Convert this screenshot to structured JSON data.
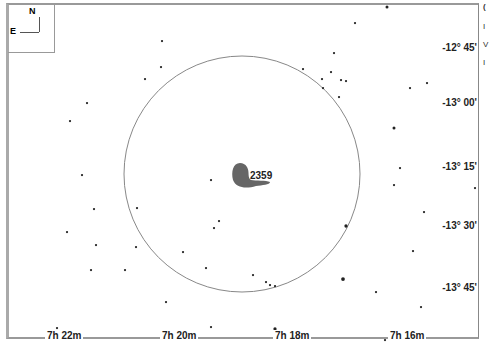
{
  "map": {
    "object_label": "2359",
    "orientation": {
      "north": "N",
      "east": "E"
    },
    "credit": "Megastar",
    "dec_labels": [
      {
        "text": "-12° 45'",
        "y": 48
      },
      {
        "text": "-13° 00'",
        "y": 103
      },
      {
        "text": "-13° 15'",
        "y": 167
      },
      {
        "text": "-13° 30'",
        "y": 226
      },
      {
        "text": "-13° 45'",
        "y": 288
      }
    ],
    "ra_labels": [
      {
        "text": "7h 22m",
        "x": 45
      },
      {
        "text": "7h 20m",
        "x": 160
      },
      {
        "text": "7h 18m",
        "x": 273
      },
      {
        "text": "7h 16m",
        "x": 388
      }
    ],
    "fov_circle": {
      "cx": 242,
      "cy": 174,
      "r": 118,
      "color": "#888888"
    },
    "nebula_color": "#666666",
    "stars": [
      [
        387,
        7,
        2
      ],
      [
        355,
        23,
        1.5
      ],
      [
        162,
        41,
        1.5
      ],
      [
        334,
        53,
        1.5
      ],
      [
        161,
        67,
        1.5
      ],
      [
        145,
        79,
        1.5
      ],
      [
        303,
        69,
        1.5
      ],
      [
        331,
        72,
        1.5
      ],
      [
        341,
        80,
        1.5
      ],
      [
        322,
        79,
        1.5
      ],
      [
        346,
        81,
        1.5
      ],
      [
        323,
        88,
        1.5
      ],
      [
        339,
        97,
        1.5
      ],
      [
        410,
        88,
        1.5
      ],
      [
        427,
        83,
        1.5
      ],
      [
        87,
        103,
        1.5
      ],
      [
        70,
        121,
        1.5
      ],
      [
        394,
        128,
        2
      ],
      [
        211,
        180,
        1.5
      ],
      [
        82,
        175,
        1.5
      ],
      [
        400,
        168,
        1.5
      ],
      [
        394,
        185,
        1.5
      ],
      [
        475,
        188,
        1.5
      ],
      [
        137,
        208,
        1.5
      ],
      [
        94,
        209,
        1.5
      ],
      [
        219,
        221,
        1.5
      ],
      [
        214,
        228,
        1.5
      ],
      [
        424,
        212,
        1.5
      ],
      [
        67,
        232,
        1.5
      ],
      [
        346,
        226,
        2.2
      ],
      [
        96,
        245,
        1.5
      ],
      [
        136,
        247,
        1.5
      ],
      [
        183,
        252,
        1.5
      ],
      [
        413,
        251,
        1.5
      ],
      [
        91,
        270,
        1.5
      ],
      [
        125,
        270,
        1.5
      ],
      [
        206,
        268,
        1.5
      ],
      [
        253,
        275,
        1.5
      ],
      [
        266,
        282,
        1.5
      ],
      [
        270,
        285,
        1.5
      ],
      [
        275,
        286,
        1.5
      ],
      [
        343,
        279,
        2.5
      ],
      [
        376,
        292,
        1.5
      ],
      [
        166,
        302,
        1.5
      ],
      [
        57,
        328,
        1.5
      ],
      [
        211,
        327,
        1.5
      ],
      [
        275,
        329,
        2.2
      ],
      [
        385,
        340,
        1.5
      ],
      [
        421,
        307,
        1.5
      ]
    ]
  },
  "sidebar_fragments": [
    "(",
    "I",
    "V",
    "I"
  ]
}
